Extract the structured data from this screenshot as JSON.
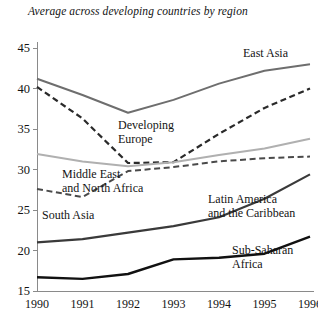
{
  "chart_data": {
    "type": "line",
    "title": "Average across developing countries by region",
    "xlabel": "",
    "ylabel": "",
    "x": [
      1990,
      1991,
      1992,
      1993,
      1994,
      1995,
      1996
    ],
    "xtick_labels": [
      "1990",
      "1991",
      "1992",
      "1993",
      "1994",
      "1995",
      "1996"
    ],
    "ytick_labels": [
      "15",
      "20",
      "25",
      "30",
      "35",
      "40",
      "45"
    ],
    "ytick_values": [
      15,
      20,
      25,
      30,
      35,
      40,
      45
    ],
    "ylim": [
      15,
      45
    ],
    "xlim": [
      1990,
      1996
    ],
    "grid": false,
    "legend": "inline-annotations",
    "series": [
      {
        "name": "East Asia",
        "values": [
          41.2,
          39.2,
          37.0,
          38.6,
          40.6,
          42.2,
          43.0
        ],
        "color": "#6e6e6e",
        "style": "solid",
        "width": 2.0
      },
      {
        "name": "Developing Europe",
        "values": [
          40.2,
          36.3,
          30.8,
          30.9,
          34.4,
          37.6,
          40.0
        ],
        "color": "#2a2a2a",
        "style": "dashed",
        "width": 2.2
      },
      {
        "name": "Middle East and North Africa",
        "values": [
          31.9,
          31.0,
          30.4,
          30.9,
          31.8,
          32.6,
          33.8
        ],
        "color": "#b0b0b0",
        "style": "solid",
        "width": 2.0
      },
      {
        "name": "South Asia",
        "values": [
          27.6,
          26.6,
          29.8,
          30.3,
          31.0,
          31.4,
          31.6
        ],
        "color": "#4a4a4a",
        "style": "dashed",
        "width": 2.0
      },
      {
        "name": "Latin America and the Caribbean",
        "values": [
          21.0,
          21.4,
          22.2,
          23.0,
          24.1,
          26.4,
          29.4
        ],
        "color": "#3a3a3a",
        "style": "solid",
        "width": 2.2
      },
      {
        "name": "Sub-Saharan Africa",
        "values": [
          16.7,
          16.5,
          17.1,
          18.9,
          19.1,
          19.6,
          21.7
        ],
        "color": "#111111",
        "style": "solid",
        "width": 2.4
      }
    ],
    "annotations": [
      {
        "text": "East Asia",
        "series": "East Asia"
      },
      {
        "text": "Developing",
        "series": "Developing Europe"
      },
      {
        "text": "Europe",
        "series": "Developing Europe"
      },
      {
        "text": "Middle East",
        "series": "Middle East and North Africa"
      },
      {
        "text": "and North Africa",
        "series": "Middle East and North Africa"
      },
      {
        "text": "South Asia",
        "series": "South Asia"
      },
      {
        "text": "Latin America",
        "series": "Latin America and the Caribbean"
      },
      {
        "text": "and the Caribbean",
        "series": "Latin America and the Caribbean"
      },
      {
        "text": "Sub-Saharan",
        "series": "Sub-Saharan Africa"
      },
      {
        "text": "Africa",
        "series": "Sub-Saharan Africa"
      }
    ],
    "axis_color": "#8a8a8a"
  }
}
